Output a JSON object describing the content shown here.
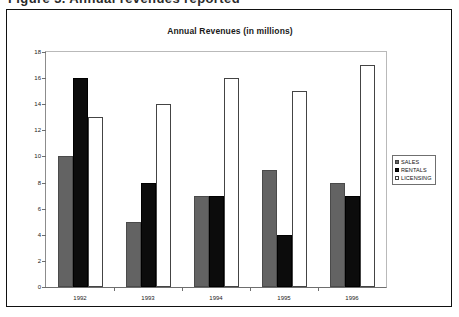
{
  "clipped_header_text": "Figure 3.  Annual revenues reported",
  "chart_data": {
    "type": "bar",
    "title": "Annual Revenues (in millions)",
    "xlabel": "",
    "ylabel": "",
    "categories": [
      "1992",
      "1993",
      "1994",
      "1995",
      "1996"
    ],
    "series": [
      {
        "name": "SALES",
        "color": "#636363",
        "values": [
          10,
          5,
          7,
          9,
          8
        ]
      },
      {
        "name": "RENTALS",
        "color": "#0c0c0c",
        "values": [
          16,
          8,
          7,
          4,
          7
        ]
      },
      {
        "name": "LICENSING",
        "color": "#ffffff",
        "values": [
          13,
          14,
          16,
          15,
          17
        ]
      }
    ],
    "ylim": [
      0,
      18
    ],
    "ytick_step": 2,
    "yticks": [
      0,
      2,
      4,
      6,
      8,
      10,
      12,
      14,
      16,
      18
    ],
    "grid": false,
    "legend_position": "right"
  },
  "legend": {
    "entries": [
      {
        "label": "SALES"
      },
      {
        "label": "RENTALS"
      },
      {
        "label": "LICENSING"
      }
    ]
  }
}
